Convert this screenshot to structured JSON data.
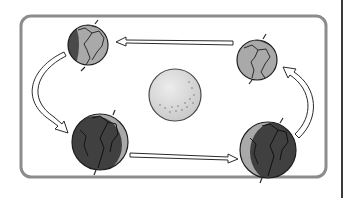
{
  "diagram": {
    "colors": {
      "frame": "#8c8c8c",
      "edge_line": "#3a3a3a",
      "globe_light": "#a9a9a9",
      "globe_dark": "#4a4a4a",
      "globe_outline": "#1e1e1e",
      "sun_fill": "#dcdcdc",
      "sun_outline": "#4a4a4a",
      "arrow_fill": "#ffffff",
      "arrow_outline": "#2a2a2a"
    },
    "elements": {
      "sun": {
        "label": "Sun",
        "cx": 175,
        "cy": 95,
        "r": 26
      },
      "globes": [
        {
          "position": "top-left",
          "cx": 88,
          "cy": 45,
          "r": 20,
          "lit": "mostly-light"
        },
        {
          "position": "top-right",
          "cx": 257,
          "cy": 60,
          "r": 20,
          "lit": "mostly-light"
        },
        {
          "position": "bottom-left",
          "cx": 100,
          "cy": 142,
          "r": 28,
          "lit": "mostly-dark"
        },
        {
          "position": "bottom-right",
          "cx": 268,
          "cy": 150,
          "r": 28,
          "lit": "mostly-dark"
        }
      ],
      "arrows": [
        {
          "name": "top-arrow",
          "direction": "right-to-left"
        },
        {
          "name": "left-arrow",
          "direction": "top-to-bottom"
        },
        {
          "name": "bottom-arrow",
          "direction": "left-to-right"
        },
        {
          "name": "right-arrow",
          "direction": "bottom-to-top"
        }
      ]
    }
  }
}
